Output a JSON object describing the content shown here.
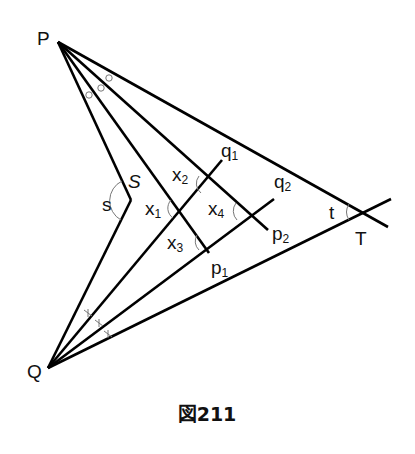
{
  "figure": {
    "caption": "図211",
    "points": {
      "P": {
        "label": "P",
        "x": 58,
        "y": 42
      },
      "Q": {
        "label": "Q",
        "x": 48,
        "y": 368
      },
      "S": {
        "label": "S",
        "x": 131,
        "y": 200
      },
      "T": {
        "label": "T",
        "x": 364,
        "y": 213
      }
    },
    "ray_labels": {
      "p1": {
        "base": "p",
        "sub": "1"
      },
      "p2": {
        "base": "p",
        "sub": "2"
      },
      "q1": {
        "base": "q",
        "sub": "1"
      },
      "q2": {
        "base": "q",
        "sub": "2"
      }
    },
    "angle_labels": {
      "s": "s",
      "t": "t",
      "x1": {
        "base": "x",
        "sub": "1"
      },
      "x2": {
        "base": "x",
        "sub": "2"
      },
      "x3": {
        "base": "x",
        "sub": "3"
      },
      "x4": {
        "base": "x",
        "sub": "4"
      }
    },
    "equal_angle_marks": {
      "at_P": "○",
      "at_Q": "×"
    }
  }
}
